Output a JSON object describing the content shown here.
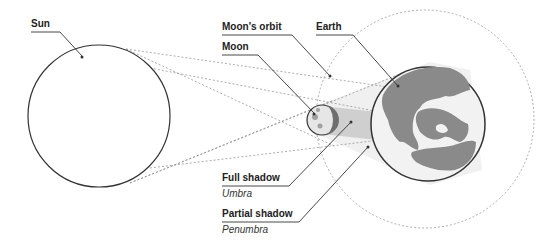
{
  "labels": {
    "sun": "Sun",
    "moons_orbit": "Moon's orbit",
    "earth": "Earth",
    "moon": "Moon",
    "full_shadow": "Full shadow",
    "umbra": "Umbra",
    "partial_shadow": "Partial shadow",
    "penumbra": "Penumbra"
  },
  "colors": {
    "outline": "#333333",
    "dashed": "#888888",
    "land": "#8a8a8a",
    "umbra_fill": "#c8c8c8",
    "penumbra_fill": "#ececec",
    "moon_dark": "#6e6e6e"
  }
}
